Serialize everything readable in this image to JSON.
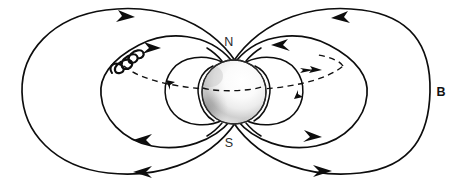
{
  "figure": {
    "type": "physics-diagram",
    "width": 461,
    "height": 185,
    "background_color": "#ffffff",
    "line_color": "#0d0d0d"
  },
  "labels": {
    "north_pole": "N",
    "south_pole": "S",
    "magnetic_field": "B"
  },
  "label_positions": {
    "north_pole": {
      "x": 229,
      "y": 43
    },
    "south_pole": {
      "x": 229,
      "y": 144
    },
    "magnetic_field": {
      "x": 441,
      "y": 93
    }
  },
  "planet": {
    "name": "planet-sphere",
    "center_x": 234,
    "center_y": 92,
    "radius": 32,
    "fill_light": "#fdfdfd",
    "fill_shadow": "#8c8c8c",
    "outline_color": "#2a2a2a"
  },
  "equator": {
    "name": "equatorial-plane",
    "style": "dashed",
    "center_x": 234,
    "center_y": 86,
    "rx": 118,
    "ry": 26,
    "arrow_direction": "right"
  },
  "particle": {
    "name": "gyrating-charged-particle",
    "description": "helical spiral trajectory on upper-left field line",
    "x": 124,
    "y": 60,
    "turns": 4,
    "angle_deg": -42
  },
  "field_lines": [
    {
      "id": "outer",
      "half_width": 206,
      "half_height": 84,
      "arrows": [
        "top-left-in",
        "bottom-left-out",
        "top-right-in",
        "bottom-right-out"
      ]
    },
    {
      "id": "middle",
      "half_width": 120,
      "half_height": 62,
      "arrows": [
        "top-left-in",
        "bottom-left-out",
        "top-right-in",
        "bottom-right-out"
      ]
    },
    {
      "id": "inner",
      "half_width": 66,
      "half_height": 40,
      "arrows": [
        "left-equator",
        "right-equator"
      ]
    },
    {
      "id": "innermost",
      "half_width": 40,
      "half_height": 28,
      "arrows": []
    }
  ],
  "arrow_semantics": {
    "left_upper": "toward-north-pole",
    "right_upper": "toward-north-pole",
    "left_lower": "away-from-south-pole",
    "right_lower": "away-from-south-pole"
  }
}
